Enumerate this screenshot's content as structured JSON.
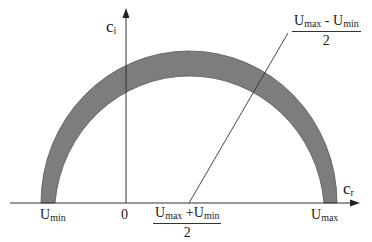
{
  "diagram": {
    "type": "semicircular-band",
    "axes": {
      "horizontal": {
        "label_main": "c",
        "label_sub": "r"
      },
      "vertical": {
        "label_main": "c",
        "label_sub": "i"
      },
      "origin_label": "0"
    },
    "tick_labels": {
      "left": {
        "main": "U",
        "sub": "min"
      },
      "right": {
        "main": "U",
        "sub": "max"
      }
    },
    "center_label": {
      "numerator": [
        {
          "main": "U",
          "sub": "max"
        },
        {
          "op": "+"
        },
        {
          "main": "U",
          "sub": "min"
        }
      ],
      "denominator": "2"
    },
    "radius_label": {
      "numerator": [
        {
          "main": "U",
          "sub": "max"
        },
        {
          "op": "-"
        },
        {
          "main": "U",
          "sub": "min"
        }
      ],
      "denominator": "2"
    },
    "colors": {
      "band": "#7d7d7d",
      "band_edge": "#555555",
      "axes": "#333333",
      "background": "#ffffff"
    }
  }
}
